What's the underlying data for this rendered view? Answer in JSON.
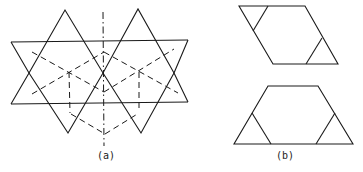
{
  "figure": {
    "panel_a": {
      "label": "(a)",
      "description": "Two overlapping triangles forming star pattern over a parallelogram band, with dashed hexagonal projection lines and dash-dot symmetry axis"
    },
    "panel_b": {
      "label": "(b)",
      "description": "Two polygons each with two corner triangles cut off: a rhombus-like parallelogram and a trapezoid"
    }
  }
}
